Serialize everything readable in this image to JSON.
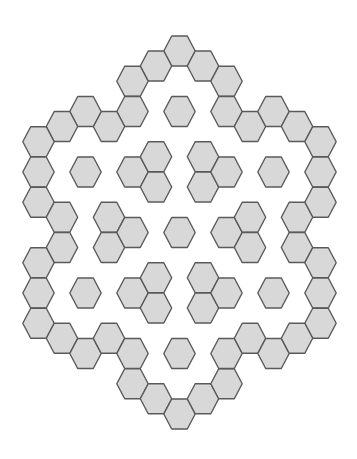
{
  "figure": {
    "width": 357,
    "height": 459,
    "background": "#ffffff",
    "hex_fill": "#d8d8d8",
    "hex_stroke": "#5a5a5a",
    "hex_stroke_width": 1.4,
    "grid": {
      "orientation": "flat-top",
      "col0_x": 38.5,
      "col_dx": 23.5,
      "even_col_y0": 51,
      "odd_col_y0": 66,
      "row_dy": 30.25,
      "hex_half_width": 15.7,
      "hex_half_edge": 7.8,
      "hex_half_height": 15
    },
    "groups": [
      {
        "name": "outer-ring",
        "cells": [
          [
            6,
            0
          ],
          [
            5,
            0
          ],
          [
            7,
            0
          ],
          [
            4,
            1
          ],
          [
            8,
            1
          ],
          [
            4,
            2
          ],
          [
            8,
            2
          ],
          [
            3,
            2
          ],
          [
            2,
            2
          ],
          [
            1,
            2
          ],
          [
            0,
            3
          ],
          [
            9,
            2
          ],
          [
            10,
            2
          ],
          [
            11,
            2
          ],
          [
            12,
            3
          ],
          [
            0,
            4
          ],
          [
            0,
            5
          ],
          [
            1,
            5
          ],
          [
            1,
            6
          ],
          [
            0,
            7
          ],
          [
            0,
            8
          ],
          [
            0,
            9
          ],
          [
            12,
            4
          ],
          [
            12,
            5
          ],
          [
            11,
            5
          ],
          [
            11,
            6
          ],
          [
            12,
            7
          ],
          [
            12,
            8
          ],
          [
            12,
            9
          ],
          [
            1,
            9
          ],
          [
            2,
            10
          ],
          [
            3,
            9
          ],
          [
            4,
            10
          ],
          [
            4,
            11
          ],
          [
            5,
            11
          ],
          [
            6,
            12
          ],
          [
            7,
            11
          ],
          [
            8,
            11
          ],
          [
            8,
            10
          ],
          [
            9,
            9
          ],
          [
            10,
            10
          ],
          [
            11,
            9
          ]
        ]
      },
      {
        "name": "inner-clusters",
        "cells": [
          [
            4,
            4
          ],
          [
            5,
            3
          ],
          [
            5,
            4
          ],
          [
            7,
            3
          ],
          [
            7,
            4
          ],
          [
            8,
            4
          ],
          [
            3,
            5
          ],
          [
            3,
            6
          ],
          [
            4,
            6
          ],
          [
            8,
            6
          ],
          [
            9,
            5
          ],
          [
            9,
            6
          ],
          [
            4,
            8
          ],
          [
            5,
            7
          ],
          [
            5,
            8
          ],
          [
            7,
            7
          ],
          [
            7,
            8
          ],
          [
            8,
            8
          ]
        ]
      },
      {
        "name": "isolated-tiles",
        "cells": [
          [
            6,
            2
          ],
          [
            2,
            4
          ],
          [
            10,
            4
          ],
          [
            6,
            6
          ],
          [
            2,
            8
          ],
          [
            10,
            8
          ],
          [
            6,
            10
          ]
        ]
      }
    ]
  }
}
